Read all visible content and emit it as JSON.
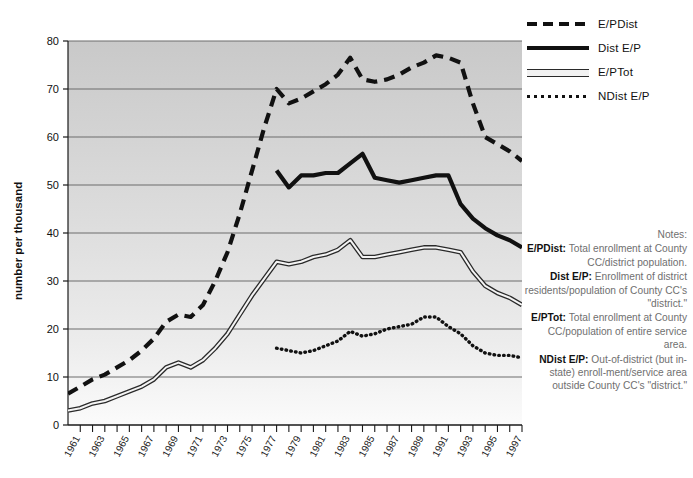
{
  "chart_data": {
    "type": "line",
    "title": "",
    "xlabel": "",
    "ylabel": "number per thousand",
    "ylim": [
      0,
      80
    ],
    "xlim": [
      1960,
      1997
    ],
    "grid": true,
    "y_ticks": [
      0,
      10,
      20,
      30,
      40,
      50,
      60,
      70,
      80
    ],
    "x_ticks": [
      1961,
      1963,
      1965,
      1967,
      1969,
      1971,
      1973,
      1975,
      1977,
      1979,
      1981,
      1983,
      1985,
      1987,
      1989,
      1991,
      1993,
      1995,
      1997
    ],
    "x_tick_labels": [
      "1961",
      "1963",
      "1965",
      "1967",
      "1969",
      "1971",
      "1973",
      "1975",
      "1977",
      "1979",
      "1981",
      "1983",
      "1985",
      "1987",
      "1989",
      "1991",
      "1993",
      "1995",
      "1997"
    ],
    "legend_position": "right-top",
    "series": [
      {
        "name": "E/PDist",
        "style": "dashed",
        "x": [
          1960,
          1961,
          1962,
          1963,
          1964,
          1965,
          1966,
          1967,
          1968,
          1969,
          1970,
          1971,
          1972,
          1973,
          1974,
          1975,
          1976,
          1977,
          1978,
          1979,
          1980,
          1981,
          1982,
          1983,
          1984,
          1985,
          1986,
          1987,
          1988,
          1989,
          1990,
          1991,
          1992,
          1993,
          1994,
          1995,
          1996,
          1997
        ],
        "values": [
          6.5,
          8.0,
          9.5,
          10.5,
          12.0,
          13.5,
          15.5,
          18.0,
          21.5,
          23.0,
          22.5,
          25.0,
          30.0,
          36.0,
          44.0,
          53.0,
          62.0,
          70.0,
          67.0,
          68.0,
          69.5,
          71.0,
          73.0,
          76.5,
          72.0,
          71.5,
          72.0,
          73.0,
          74.5,
          75.5,
          77.0,
          76.5,
          75.5,
          67.0,
          60.0,
          58.5,
          57.0,
          55.0
        ]
      },
      {
        "name": "Dist E/P",
        "style": "solid",
        "x": [
          1977,
          1978,
          1979,
          1980,
          1981,
          1982,
          1983,
          1984,
          1985,
          1986,
          1987,
          1988,
          1989,
          1990,
          1991,
          1992,
          1993,
          1994,
          1995,
          1996,
          1997
        ],
        "values": [
          53.0,
          49.5,
          52.0,
          52.0,
          52.5,
          52.5,
          54.5,
          56.5,
          51.5,
          51.0,
          50.5,
          51.0,
          51.5,
          52.0,
          52.0,
          46.0,
          43.0,
          41.0,
          39.5,
          38.5,
          37.0
        ]
      },
      {
        "name": "E/PTot",
        "style": "double",
        "x": [
          1960,
          1961,
          1962,
          1963,
          1964,
          1965,
          1966,
          1967,
          1968,
          1969,
          1970,
          1971,
          1972,
          1973,
          1974,
          1975,
          1976,
          1977,
          1978,
          1979,
          1980,
          1981,
          1982,
          1983,
          1984,
          1985,
          1986,
          1987,
          1988,
          1989,
          1990,
          1991,
          1992,
          1993,
          1994,
          1995,
          1996,
          1997
        ],
        "values": [
          3.0,
          3.5,
          4.5,
          5.0,
          6.0,
          7.0,
          8.0,
          9.5,
          12.0,
          13.0,
          12.0,
          13.5,
          16.0,
          19.0,
          23.0,
          27.0,
          30.5,
          34.0,
          33.5,
          34.0,
          35.0,
          35.5,
          36.5,
          38.5,
          35.0,
          35.0,
          35.5,
          36.0,
          36.5,
          37.0,
          37.0,
          36.5,
          36.0,
          32.0,
          29.0,
          27.5,
          26.5,
          25.0
        ]
      },
      {
        "name": "NDist E/P",
        "style": "dotted",
        "x": [
          1977,
          1978,
          1979,
          1980,
          1981,
          1982,
          1983,
          1984,
          1985,
          1986,
          1987,
          1988,
          1989,
          1990,
          1991,
          1992,
          1993,
          1994,
          1995,
          1996,
          1997
        ],
        "values": [
          16.0,
          15.5,
          15.0,
          15.5,
          16.5,
          17.5,
          19.5,
          18.5,
          19.0,
          20.0,
          20.5,
          21.0,
          22.5,
          22.5,
          20.5,
          19.0,
          16.5,
          15.0,
          14.5,
          14.5,
          14.0
        ]
      }
    ]
  },
  "legend": {
    "items": [
      {
        "label": "E/PDist",
        "style": "dashed"
      },
      {
        "label": "Dist E/P",
        "style": "solid"
      },
      {
        "label": "E/PTot",
        "style": "double"
      },
      {
        "label": "NDist E/P",
        "style": "dotted"
      }
    ]
  },
  "notes": {
    "heading": "Notes:",
    "entries": [
      {
        "term": "E/PDist:",
        "text": " Total enrollment at County CC/district population."
      },
      {
        "term": "Dist E/P:",
        "text": " Enrollment of district residents/population of County CC's \"district.\""
      },
      {
        "term": "E/PTot:",
        "text": " Total enrollment at County CC/population of entire service area."
      },
      {
        "term": "NDist E/P:",
        "text": " Out-of-district (but in-state) enroll-ment/service area outside County CC's \"district.\""
      }
    ]
  },
  "axis": {
    "y_label": "number per thousand"
  }
}
